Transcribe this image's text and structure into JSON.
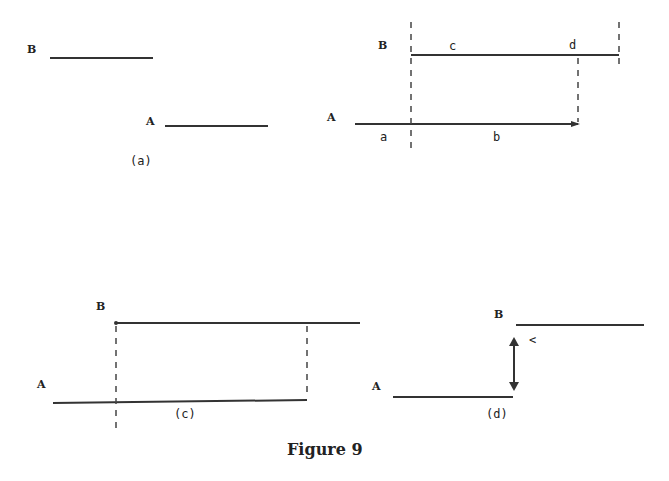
{
  "figure": {
    "caption": "Figure 9",
    "panels": {
      "a": {
        "caption": "(a)",
        "label_B": "B",
        "label_A": "A"
      },
      "b": {
        "label_B": "B",
        "label_A": "A",
        "segment_labels": [
          "a",
          "b",
          "c",
          "d"
        ]
      },
      "c": {
        "caption": "(c)",
        "label_B": "B",
        "label_A": "A"
      },
      "d": {
        "caption": "(d)",
        "label_B": "B",
        "label_A": "A",
        "arrow_label": "<"
      }
    }
  }
}
